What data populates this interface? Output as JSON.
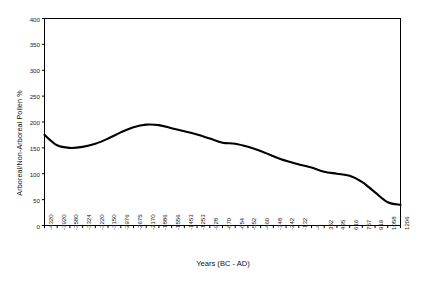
{
  "chart_data": {
    "type": "line",
    "title": "",
    "xlabel": "Years (BC - AD)",
    "ylabel": "Arboreal/Non-Arboreal Pollen %",
    "ylim": [
      0,
      400
    ],
    "yticks": [
      0,
      50,
      100,
      150,
      200,
      250,
      300,
      350,
      400
    ],
    "grid": false,
    "legend": false,
    "categories": [
      "-4320",
      "-3920",
      "-3580",
      "-3324",
      "-3220",
      "-3150",
      "-2976",
      "-2675",
      "-2170",
      "-1886",
      "-1556",
      "-1453",
      "-1253",
      "-928",
      "-670",
      "-654",
      "-552",
      "-460",
      "-348",
      "-242",
      "-132",
      "-4",
      "352",
      "495",
      "616",
      "757",
      "919",
      "1058",
      "1206"
    ],
    "series": [
      {
        "name": "Arboreal/Non-Arboreal Pollen %",
        "color": "#000000",
        "values": [
          175,
          155,
          150,
          152,
          158,
          168,
          180,
          190,
          195,
          194,
          188,
          182,
          176,
          168,
          160,
          158,
          152,
          144,
          134,
          125,
          118,
          112,
          104,
          100,
          96,
          84,
          64,
          45,
          40
        ]
      }
    ]
  },
  "axes": {
    "frame_color": "#000000",
    "line_color": "#000000"
  }
}
